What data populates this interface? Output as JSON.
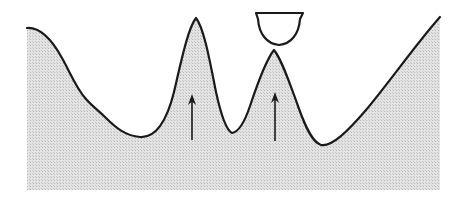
{
  "figure": {
    "title": "",
    "caption": "",
    "canvas": {
      "width": 463,
      "height": 199,
      "background": "#ffffff"
    },
    "colors": {
      "outline": "#1a1a1a",
      "fill_gray": "#d9d9d9",
      "halftone_dot": "#b8b8b8",
      "bowl_fill": "#ffffff",
      "arrow": "#1a1a1a",
      "page_background": "#ffffff"
    },
    "labels": [],
    "elements": {
      "terrain_name": "shaded-terrain-profile",
      "detached_name": "bowl-shape",
      "arrow_count": 2
    }
  },
  "chart_data": {
    "type": "area",
    "title": "",
    "xlabel": "",
    "ylabel": "",
    "grid": false,
    "legend": "none",
    "xlim": [
      27,
      440
    ],
    "ylim": [
      190,
      12
    ],
    "terrain_region": {
      "name": "shaded-terrain",
      "fill": "#d9d9d9",
      "stroke": "#1a1a1a",
      "stroke_width": 2.2,
      "left_x": 27,
      "right_x": 440,
      "baseline_y": 190,
      "profile_path": "M 27,28 C 40,27 52,40 62,58 C 70,72 76,88 86,99 C 92,106 98,110 106,118 C 116,128 126,136 140,137 C 155,138 166,124 174,92 C 181,62 188,28 196,18 C 204,28 210,62 216,92 C 223,124 228,131 232,133 C 238,132 244,124 250,106 C 258,82 266,60 274,50 C 282,60 290,84 298,106 C 305,126 312,142 321,145 C 332,147 348,131 366,110 C 388,84 416,44 440,17",
      "key_points": [
        {
          "name": "left-top-edge",
          "x": 27,
          "y": 28
        },
        {
          "name": "left-shoulder",
          "x": 88,
          "y": 100
        },
        {
          "name": "first-valley-bottom",
          "x": 140,
          "y": 137
        },
        {
          "name": "first-peak-apex",
          "x": 196,
          "y": 18
        },
        {
          "name": "middle-valley-bottom",
          "x": 232,
          "y": 133
        },
        {
          "name": "second-peak-apex",
          "x": 274,
          "y": 50
        },
        {
          "name": "right-valley-bottom",
          "x": 321,
          "y": 145
        },
        {
          "name": "right-top-edge",
          "x": 440,
          "y": 17
        }
      ]
    },
    "bowl": {
      "name": "bowl-half-disc",
      "description": "semicircular bowl with flat edge on top, open upward outline, unfilled",
      "fill": "#ffffff",
      "stroke": "#1a1a1a",
      "stroke_width": 2.2,
      "top_left_x": 256,
      "top_right_x": 303,
      "top_y": 13,
      "bottom_y": 45,
      "center_x": 279,
      "path": "M 256,13 L 303,13 L 300,19 C 299,34 291,44 279,45 C 267,44 259,34 258,19 Z"
    },
    "arrows": [
      {
        "name": "arrow-first-peak",
        "x": 192,
        "tip_y": 94,
        "tail_y": 140,
        "length": 46,
        "direction": "up",
        "color": "#1a1a1a"
      },
      {
        "name": "arrow-second-peak",
        "x": 275,
        "tip_y": 92,
        "tail_y": 141,
        "length": 49,
        "direction": "up",
        "color": "#1a1a1a"
      }
    ]
  }
}
